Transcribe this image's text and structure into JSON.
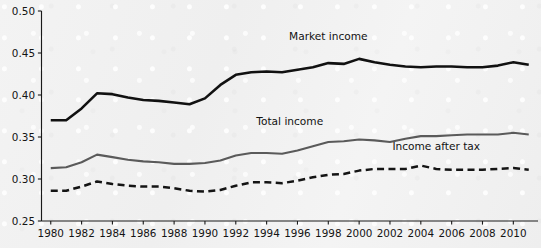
{
  "chart_data": {
    "type": "line",
    "title": "",
    "subtitle": "",
    "xlabel": "",
    "ylabel": "",
    "xlim": [
      1979.4,
      2011.6
    ],
    "ylim": [
      0.25,
      0.5
    ],
    "grid": false,
    "legend_position": "inline-labels",
    "y_ticks": [
      "0.50",
      "0.45",
      "0.40",
      "0.35",
      "0.30",
      "0.25"
    ],
    "y_tick_values": [
      0.5,
      0.45,
      0.4,
      0.35,
      0.3,
      0.25
    ],
    "x_ticks": [
      "1980",
      "1982",
      "1984",
      "1986",
      "1988",
      "1990",
      "1992",
      "1994",
      "1996",
      "1998",
      "2000",
      "2002",
      "2004",
      "2006",
      "2008",
      "2010"
    ],
    "x_tick_values": [
      1980,
      1982,
      1984,
      1986,
      1988,
      1990,
      1992,
      1994,
      1996,
      1998,
      2000,
      2002,
      2004,
      2006,
      2008,
      2010
    ],
    "x": [
      1980,
      1981,
      1982,
      1983,
      1984,
      1985,
      1986,
      1987,
      1988,
      1989,
      1990,
      1991,
      1992,
      1993,
      1994,
      1995,
      1996,
      1997,
      1998,
      1999,
      2000,
      2001,
      2002,
      2003,
      2004,
      2005,
      2006,
      2007,
      2008,
      2009,
      2010,
      2011
    ],
    "series": [
      {
        "name": "Market income",
        "color": "#111111",
        "style": "solid",
        "label_x": 1998.0,
        "label_y": 0.466,
        "values": [
          0.37,
          0.37,
          0.384,
          0.402,
          0.401,
          0.397,
          0.394,
          0.393,
          0.391,
          0.389,
          0.396,
          0.412,
          0.424,
          0.427,
          0.428,
          0.427,
          0.43,
          0.433,
          0.438,
          0.437,
          0.443,
          0.439,
          0.436,
          0.434,
          0.433,
          0.434,
          0.434,
          0.433,
          0.433,
          0.435,
          0.439,
          0.436
        ]
      },
      {
        "name": "Total income",
        "color": "#5a5a5a",
        "style": "solid",
        "label_x": 1995.5,
        "label_y": 0.364,
        "values": [
          0.313,
          0.314,
          0.32,
          0.329,
          0.326,
          0.323,
          0.321,
          0.32,
          0.318,
          0.318,
          0.319,
          0.322,
          0.328,
          0.331,
          0.331,
          0.33,
          0.334,
          0.339,
          0.344,
          0.345,
          0.347,
          0.346,
          0.344,
          0.348,
          0.351,
          0.351,
          0.352,
          0.353,
          0.353,
          0.353,
          0.355,
          0.353
        ]
      },
      {
        "name": "Income after tax",
        "color": "#141414",
        "style": "dashed",
        "label_x": 2005.0,
        "label_y": 0.334,
        "values": [
          0.286,
          0.286,
          0.291,
          0.297,
          0.294,
          0.292,
          0.291,
          0.291,
          0.289,
          0.286,
          0.285,
          0.287,
          0.292,
          0.296,
          0.296,
          0.295,
          0.298,
          0.302,
          0.305,
          0.306,
          0.31,
          0.312,
          0.312,
          0.312,
          0.316,
          0.312,
          0.311,
          0.311,
          0.311,
          0.312,
          0.313,
          0.311
        ]
      }
    ]
  }
}
